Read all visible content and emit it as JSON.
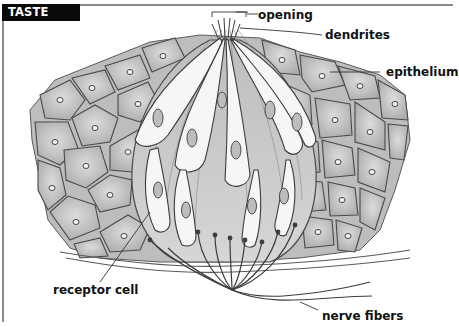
{
  "title": "TASTE BUD",
  "colors": {
    "frame": "#8a8a8a",
    "badge_bg": "#0a0a0a",
    "badge_text": "#ffffff",
    "cell_fill": "#c9c9c9",
    "cell_outline": "#4a4a4a",
    "receptor_fill": "#f4f4f4",
    "label_text": "#111111"
  },
  "labels": {
    "opening": "opening",
    "dendrites": "dendrites",
    "epithelium": "epithelium",
    "receptor_cell": "receptor cell",
    "nerve_fibers": "nerve fibers"
  }
}
